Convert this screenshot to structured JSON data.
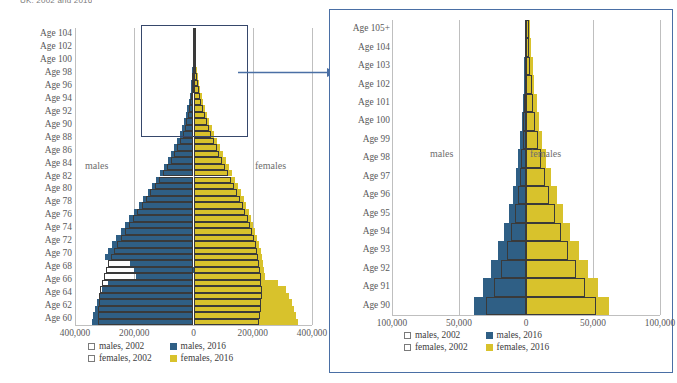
{
  "top_caption": "UK, 2002 and 2016",
  "colors": {
    "male_2016": "#2f5f85",
    "female_2016": "#d8c22c",
    "outline_2002": "#3a3a3a",
    "selection_rect": "#36476b",
    "zoom_frame": "#4a6fa5",
    "gridline": "#bfbfbf"
  },
  "legend": {
    "items": [
      {
        "label": "males, 2002",
        "style": "hollow",
        "icon": "square-outline-icon"
      },
      {
        "label": "males, 2016",
        "style": "solid-male",
        "icon": "square-filled-icon"
      },
      {
        "label": "females, 2002",
        "style": "hollow",
        "icon": "square-outline-icon"
      },
      {
        "label": "females, 2016",
        "style": "solid-female",
        "icon": "square-filled-icon"
      }
    ]
  },
  "annotations": {
    "males": "males",
    "females": "females"
  },
  "chart_data": [
    {
      "id": "overview",
      "type": "bar",
      "orientation": "population-pyramid",
      "title": "UK population pyramid, ages 60-104",
      "xlabel": "",
      "ylabel": "",
      "grid": true,
      "legend_position": "bottom",
      "xlim": [
        -400000,
        400000
      ],
      "xticks": [
        "400,000",
        "200,000",
        "0",
        "200,000",
        "400,000"
      ],
      "xtick_values": [
        -400000,
        -200000,
        0,
        200000,
        400000
      ],
      "ytick_labels": [
        "Age 104",
        "Age 102",
        "Age 100",
        "Age 98",
        "Age 96",
        "Age 94",
        "Age 92",
        "Age 90",
        "Age 88",
        "Age 86",
        "Age 84",
        "Age 82",
        "Age 80",
        "Age 78",
        "Age 76",
        "Age 74",
        "Age 72",
        "Age 70",
        "Age 68",
        "Age 66",
        "Age 64",
        "Age 62",
        "Age 60"
      ],
      "ages": [
        105,
        104,
        103,
        102,
        101,
        100,
        99,
        98,
        97,
        96,
        95,
        94,
        93,
        92,
        91,
        90,
        89,
        88,
        87,
        86,
        85,
        84,
        83,
        82,
        81,
        80,
        79,
        78,
        77,
        76,
        75,
        74,
        73,
        72,
        71,
        70,
        69,
        68,
        67,
        66,
        65,
        64,
        63,
        62,
        61,
        60
      ],
      "series": [
        {
          "name": "males, 2016",
          "side": "left",
          "values": [
            700,
            900,
            1200,
            1700,
            2300,
            3100,
            4200,
            5600,
            7400,
            9700,
            12600,
            16200,
            20600,
            25800,
            31800,
            38700,
            46500,
            55200,
            64800,
            75300,
            86700,
            99000,
            112000,
            125700,
            140000,
            154800,
            170000,
            185400,
            200900,
            216300,
            231500,
            246300,
            260600,
            274200,
            287000,
            299000,
            214000,
            200000,
            194000,
            287000,
            309000,
            318000,
            326000,
            333000,
            339000,
            344000
          ]
        },
        {
          "name": "females, 2016",
          "side": "right",
          "values": [
            3200,
            4000,
            5000,
            6300,
            7900,
            9900,
            12300,
            15200,
            18700,
            22800,
            27600,
            33100,
            39300,
            46200,
            53800,
            62000,
            70800,
            80100,
            89800,
            99800,
            110000,
            120300,
            130600,
            140800,
            150800,
            160500,
            169800,
            178700,
            187100,
            195000,
            202400,
            209200,
            215500,
            221200,
            226400,
            231000,
            235100,
            238600,
            241600,
            284000,
            312000,
            322000,
            331000,
            339000,
            346000,
            352000
          ]
        },
        {
          "name": "males, 2002",
          "side": "left",
          "style": "outline",
          "values": [
            400,
            500,
            700,
            1000,
            1400,
            1900,
            2600,
            3500,
            4700,
            6300,
            8400,
            11100,
            14500,
            18700,
            23800,
            29900,
            37100,
            45400,
            54800,
            65300,
            76800,
            89200,
            102400,
            116300,
            130700,
            145500,
            160500,
            175500,
            190400,
            205000,
            219200,
            232800,
            245700,
            257800,
            269000,
            279200,
            288400,
            296500,
            303500,
            309400,
            314200,
            317900,
            320500,
            322000,
            322400,
            321700
          ]
        },
        {
          "name": "females, 2002",
          "side": "right",
          "style": "outline",
          "values": [
            2000,
            2600,
            3300,
            4300,
            5500,
            7000,
            8900,
            11200,
            14000,
            17400,
            21400,
            26100,
            31500,
            37600,
            44400,
            51900,
            60000,
            68700,
            77900,
            87500,
            97400,
            107500,
            117700,
            127900,
            138000,
            147900,
            157500,
            166700,
            175400,
            183600,
            191200,
            198200,
            204500,
            210100,
            215000,
            219200,
            222700,
            225500,
            227600,
            229000,
            229700,
            229700,
            229000,
            227600,
            225500,
            222700
          ]
        }
      ]
    },
    {
      "id": "zoomed",
      "type": "bar",
      "orientation": "population-pyramid",
      "title": "UK population pyramid, ages 90-105+",
      "xlabel": "",
      "ylabel": "",
      "grid": true,
      "legend_position": "bottom",
      "xlim": [
        -100000,
        100000
      ],
      "xticks": [
        "100,000",
        "50,000",
        "0",
        "50,000",
        "100,000"
      ],
      "xtick_values": [
        -100000,
        -50000,
        0,
        50000,
        100000
      ],
      "ytick_labels": [
        "Age 105+",
        "Age 104",
        "Age 103",
        "Age 102",
        "Age 101",
        "Age 100",
        "Age 99",
        "Age 98",
        "Age 97",
        "Age 96",
        "Age 95",
        "Age 94",
        "Age 93",
        "Age 92",
        "Age 91",
        "Age 90"
      ],
      "ages": [
        105,
        104,
        103,
        102,
        101,
        100,
        99,
        98,
        97,
        96,
        95,
        94,
        93,
        92,
        91,
        90
      ],
      "series": [
        {
          "name": "males, 2016",
          "side": "left",
          "values": [
            700,
            900,
            1200,
            1700,
            2300,
            3100,
            4200,
            5600,
            7400,
            9700,
            12600,
            16200,
            20600,
            25800,
            31800,
            38700
          ]
        },
        {
          "name": "females, 2016",
          "side": "right",
          "values": [
            3200,
            4000,
            5000,
            6300,
            7900,
            9900,
            12300,
            15200,
            18700,
            22800,
            27600,
            33100,
            39300,
            46200,
            53800,
            62000
          ]
        },
        {
          "name": "males, 2002",
          "side": "left",
          "style": "outline",
          "values": [
            400,
            500,
            700,
            1000,
            1400,
            1900,
            2600,
            3500,
            4700,
            6300,
            8400,
            11100,
            14500,
            18700,
            23800,
            29900
          ]
        },
        {
          "name": "females, 2002",
          "side": "right",
          "style": "outline",
          "values": [
            2000,
            2600,
            3300,
            4300,
            5500,
            7000,
            8900,
            11200,
            14000,
            17400,
            21400,
            26100,
            31500,
            37600,
            44400,
            51900
          ]
        }
      ]
    }
  ]
}
